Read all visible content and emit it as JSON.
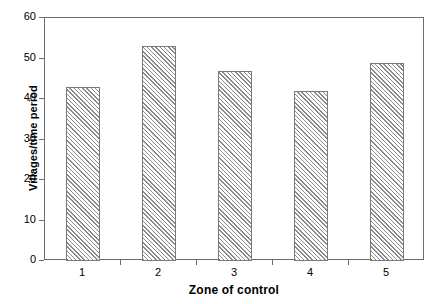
{
  "chart_data": {
    "type": "bar",
    "title": "",
    "subtitle": "",
    "xlabel": "Zone of control",
    "ylabel": "Villages/time period",
    "categories": [
      "1",
      "2",
      "3",
      "4",
      "5"
    ],
    "values": [
      43,
      53,
      47,
      42,
      49
    ],
    "series": [
      {
        "name": "Villages/time period",
        "values": [
          43,
          53,
          47,
          42,
          49
        ]
      }
    ],
    "ylim": [
      0,
      60
    ],
    "yticks": [
      0,
      10,
      20,
      30,
      40,
      50,
      60
    ],
    "ytick_labels": [
      "0",
      "10",
      "20",
      "30",
      "40",
      "50",
      "60"
    ],
    "xtick_labels": [
      "1",
      "2",
      "3",
      "4",
      "5"
    ],
    "grid": false,
    "legend": false,
    "legend_position": "none",
    "bar_fill": "diagonal-hatch",
    "bar_edge_color": "#7a7a7a",
    "bar_hatch_color": "#8a8a8a",
    "frame_color": "#6d6d6d",
    "background_color": "#ffffff",
    "annotations": []
  }
}
